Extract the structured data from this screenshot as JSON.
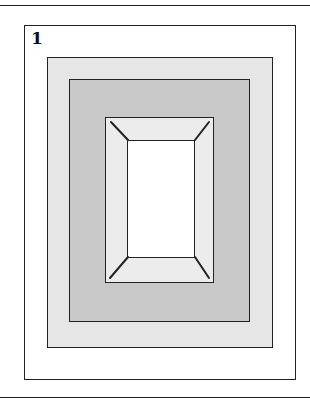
{
  "figure": {
    "number_label": "1",
    "colors": {
      "background": "#ffffff",
      "outer_box": "#ffffff",
      "light_band": "#e6e6e6",
      "mid_band": "#c8c8c8",
      "frame": "#ececec",
      "inner_window": "#ffffff",
      "stroke": "#222222"
    }
  }
}
